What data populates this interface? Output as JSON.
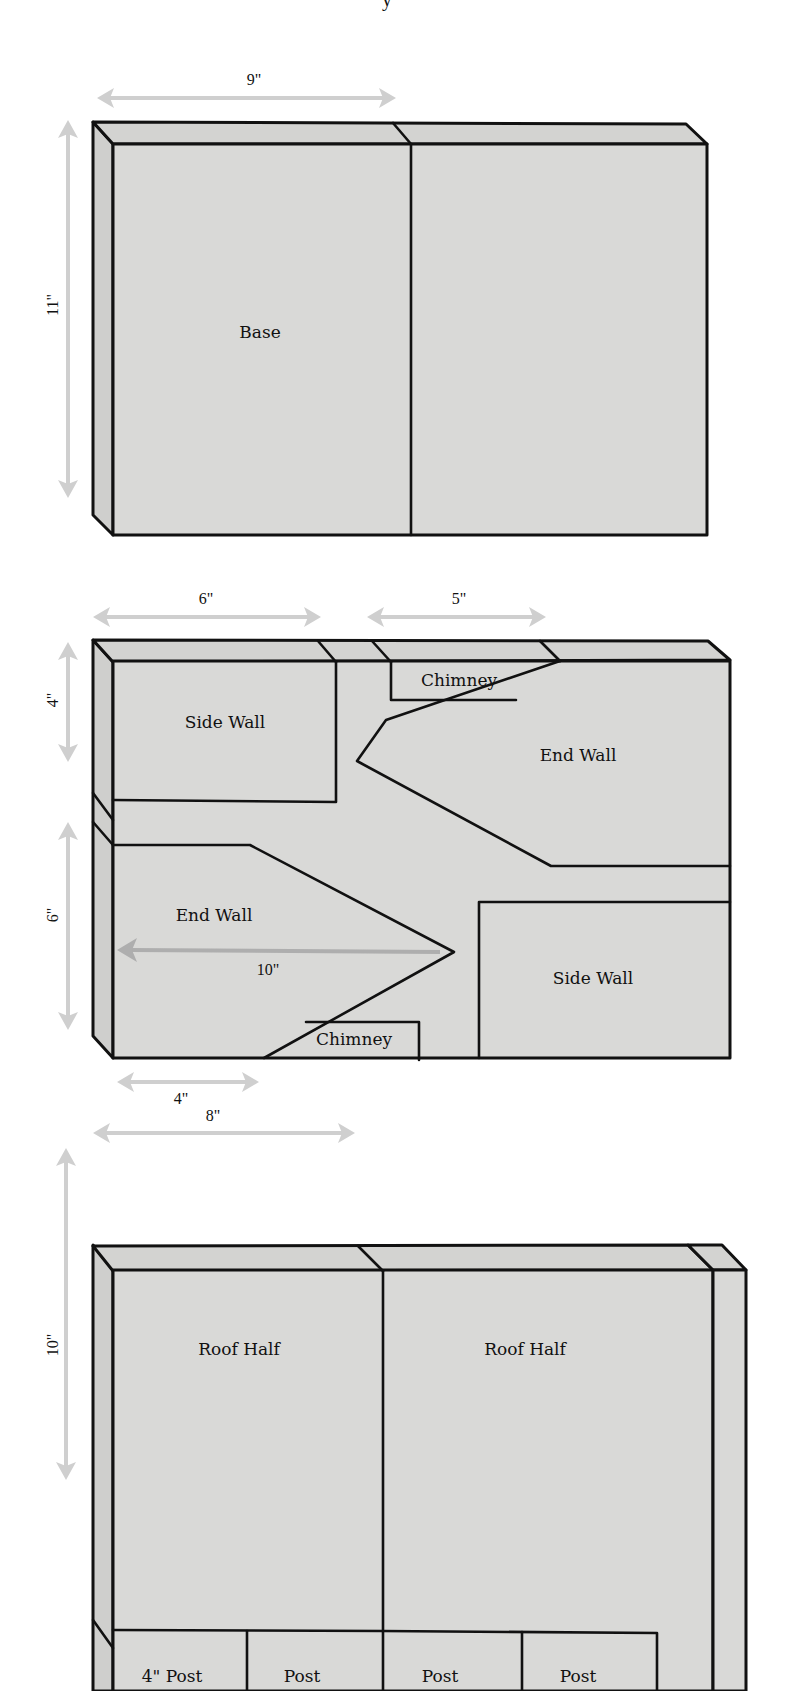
{
  "page": {
    "background": "#ffffff",
    "board_color": "#d9d9d7",
    "line_color": "#111111",
    "dimension_arrow_color": "#cfcfcf"
  },
  "boards": [
    {
      "id": "board-1",
      "name": "base-board",
      "top": 122,
      "left": 93,
      "right": 707,
      "bottom": 535,
      "bevel_x": 20,
      "bevel_y": 22,
      "top_dividers": [
        {
          "x_top": 393,
          "x_face": 411
        }
      ],
      "face_dividers": [
        {
          "x": 411,
          "y1": 144,
          "y2": 535
        }
      ],
      "pieces": [
        {
          "label": "Base",
          "x": 260,
          "y": 338
        }
      ],
      "dimensions": [
        {
          "label": "9\"",
          "orientation": "horizontal",
          "x1": 100,
          "x2": 393,
          "y": 98,
          "label_x": 254,
          "label_y": 85
        },
        {
          "label": "11\"",
          "orientation": "vertical",
          "x": 66,
          "y1": 122,
          "y2": 496,
          "label_x": 62,
          "label_y": 305
        }
      ]
    },
    {
      "id": "board-2",
      "name": "walls-board",
      "top": 640,
      "left": 93,
      "right": 730,
      "bottom": 1058,
      "bevel_x": 20,
      "bevel_y": 22,
      "pieces": [
        {
          "label": "Side Wall",
          "x": 225,
          "y": 728
        },
        {
          "label": "Chimney",
          "x": 459,
          "y": 686
        },
        {
          "label": "End Wall",
          "x": 575,
          "y": 761
        },
        {
          "label": "End Wall",
          "x": 213,
          "y": 921
        },
        {
          "label": "Side Wall",
          "x": 593,
          "y": 984
        },
        {
          "label": "Chimney",
          "x": 354,
          "y": 1045
        }
      ],
      "dimensions": [
        {
          "label": "6\"",
          "orientation": "horizontal",
          "x1": 95,
          "x2": 320,
          "y": 617,
          "label_x": 206,
          "label_y": 605
        },
        {
          "label": "5\"",
          "orientation": "horizontal",
          "x1": 368,
          "x2": 543,
          "y": 617,
          "label_x": 459,
          "label_y": 605
        },
        {
          "label": "4\"",
          "orientation": "vertical",
          "x": 68,
          "y1": 642,
          "y2": 760,
          "label_x": 62,
          "label_y": 700
        },
        {
          "label": "6\"",
          "orientation": "vertical",
          "x": 68,
          "y1": 822,
          "y2": 1030,
          "label_x": 62,
          "label_y": 915
        },
        {
          "label": "10\"",
          "orientation": "horizontal-inner",
          "x1": 118,
          "x2": 444,
          "y": 950,
          "label_x": 268,
          "label_y": 974
        },
        {
          "label": "4\"",
          "orientation": "horizontal",
          "x1": 118,
          "x2": 256,
          "y": 1082,
          "label_x": 181,
          "label_y": 1104
        }
      ]
    },
    {
      "id": "board-3",
      "name": "roof-board",
      "top": 1245,
      "left": 93,
      "right": 746,
      "bottom": 1691,
      "bevel_x": 20,
      "bevel_y": 22,
      "pieces": [
        {
          "label": "Roof Half",
          "x": 239,
          "y": 1355
        },
        {
          "label": "Roof Half",
          "x": 525,
          "y": 1355
        },
        {
          "label": "4\" Post",
          "x": 172,
          "y": 1682
        },
        {
          "label": "Post",
          "x": 302,
          "y": 1682
        },
        {
          "label": "Post",
          "x": 440,
          "y": 1682
        },
        {
          "label": "Post",
          "x": 578,
          "y": 1682
        }
      ],
      "dimensions": [
        {
          "label": "8\"",
          "orientation": "horizontal",
          "x1": 95,
          "x2": 352,
          "y": 1133,
          "label_x": 213,
          "label_y": 1122
        },
        {
          "label": "10\"",
          "orientation": "vertical",
          "x": 66,
          "y1": 1148,
          "y2": 1478,
          "label_x": 62,
          "label_y": 1358
        }
      ]
    }
  ]
}
